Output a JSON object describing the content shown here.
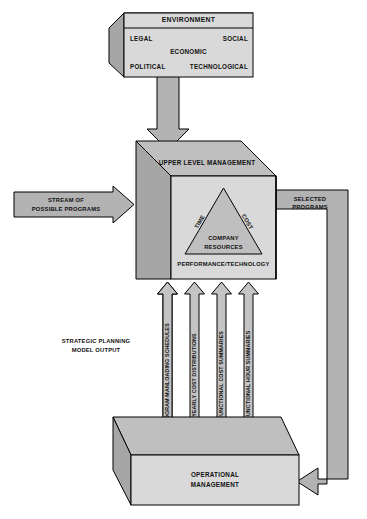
{
  "diagram": {
    "colors": {
      "face_light": "#d9d9d9",
      "face_mid": "#bfbfbf",
      "face_dark": "#a6a6a6",
      "arrow_fill": "#b3b3b3",
      "arrow_fill_light": "#c4c4c4",
      "white": "#ffffff",
      "stroke": "#000000",
      "text": "#111111"
    },
    "environment_box": {
      "title": "ENVIRONMENT",
      "factors": {
        "top_left": "LEGAL",
        "top_right": "SOCIAL",
        "center": "ECONOMIC",
        "bottom_left": "POLITICAL",
        "bottom_right": "TECHNOLOGICAL"
      }
    },
    "upper_box": {
      "title": "UPPER LEVEL MANAGEMENT",
      "triangle": {
        "left_edge": "TIME",
        "right_edge": "COST",
        "base": "PERFORMANCE/TECHNOLOGY",
        "center_line1": "COMPANY",
        "center_line2": "RESOURCES"
      }
    },
    "operational_box": {
      "line1": "OPERATIONAL",
      "line2": "MANAGEMENT"
    },
    "input_arrow": {
      "line1": "STREAM OF",
      "line2": "POSSIBLE PROGRAMS"
    },
    "output_arrow": {
      "line1": "SELECTED",
      "line2": "PROGRAMS"
    },
    "model_output": {
      "line1": "STRATEGIC PLANNING",
      "line2": "MODEL OUTPUT"
    },
    "output_streams": [
      {
        "label": "PROGRAM MANLOADING SCHEDULES"
      },
      {
        "label": "YEARLY COST DISTRIBUTIONS"
      },
      {
        "label": "FUNCTIONAL COST SUMMARIES"
      },
      {
        "label": "FUNCTIONAL HOUR SUMMARIES"
      }
    ]
  }
}
